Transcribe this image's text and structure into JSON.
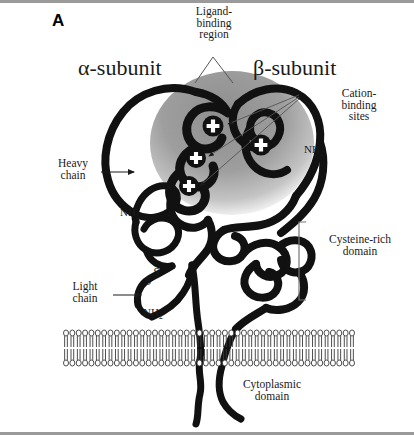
{
  "figure": {
    "panel_letter": "A",
    "background_color": "#ffffff",
    "chain_color": "#111111",
    "ligand_region_color": "#9b9b9b",
    "border_color": "#9a9a9a"
  },
  "labels": {
    "alpha_subunit": "α-subunit",
    "beta_subunit": "β-subunit",
    "ligand_binding_region": "Ligand-\nbinding\nregion",
    "cation_binding_sites": "Cation-\nbinding\nsites",
    "heavy_chain": "Heavy\nchain",
    "light_chain": "Light\nchain",
    "cysteine_rich_domain": "Cysteine-rich\ndomain",
    "cytoplasmic_domain": "Cytoplasmic\ndomain",
    "nh2_alpha_heavy": "NH",
    "nh2_alpha_sub": "2",
    "nh2_beta": "NH",
    "nh2_beta_sub": "2",
    "nh2_light": "NH",
    "nh2_light_sub": "2",
    "disulfide_s_upper": "S",
    "disulfide_s_lower": "S"
  },
  "annotations": {
    "cation_site_glyph": "+",
    "cation_site_count": 4,
    "leader_lines_ligand": 2,
    "leader_lines_cation": 3,
    "arrow_heavy_chain": true,
    "arrow_light_chain": true,
    "bracket_cysteine_domain": true
  },
  "membrane": {
    "name": "phospholipid-bilayer",
    "lipid_count_per_leaflet": 46,
    "leaflets": 2,
    "top_y": 333,
    "bottom_y": 363
  }
}
